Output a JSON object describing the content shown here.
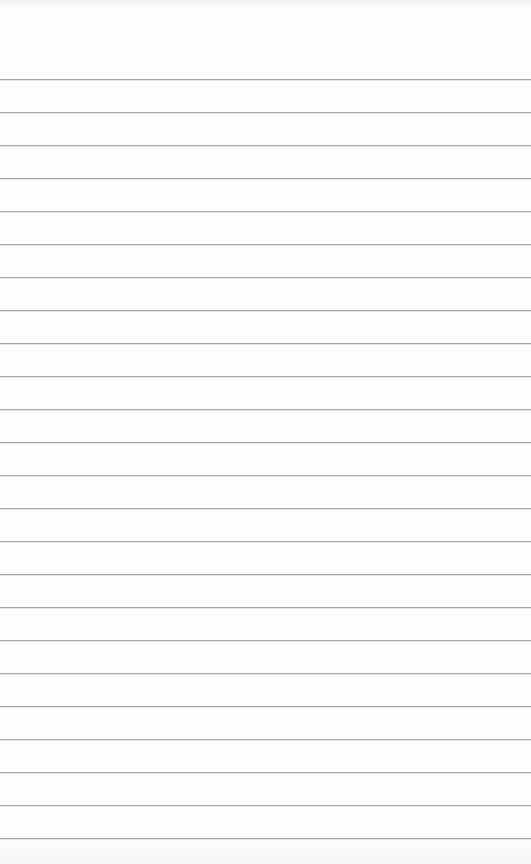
{
  "page": {
    "type": "lined-notepad",
    "background_color": "#fdfdfd",
    "line_color": "#a8a8a8",
    "first_line_y": 79,
    "line_spacing": 33,
    "line_count": 24
  }
}
